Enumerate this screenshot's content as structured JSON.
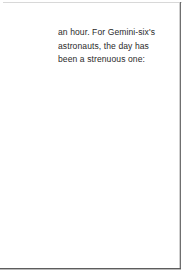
{
  "page": {
    "background_color": "#ffffff",
    "text_color": "#2a2a2a",
    "edge_color": "#5d5d5d"
  },
  "body_text": {
    "lines": [
      "an hour. For Gemini-six's",
      "astronauts, the day has",
      "been a strenuous one:"
    ],
    "full_text": "an hour. For Gemini-six's astronauts, the day has been a strenuous one:"
  }
}
